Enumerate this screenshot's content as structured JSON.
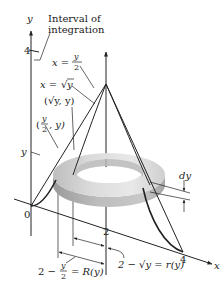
{
  "figure": {
    "axes": {
      "y_axis_label": "y",
      "x_axis_label": "x",
      "origin_label": "0",
      "y_tick_4": "4",
      "x_tick_2": "2",
      "x_tick_4": "4",
      "y_marker": "y"
    },
    "annotations": {
      "interval_line1": "Interval of",
      "interval_line2": "integration",
      "x_eq_label": "x =",
      "y_over_2_num": "y",
      "y_over_2_den": "2",
      "x_eq_sqrt_prefix": "x =",
      "sqrt_y": "y",
      "point_sqrt": "(√y, y)",
      "point_half_open": "(",
      "point_half_num": "y",
      "point_half_den": "2",
      "point_half_close": ", y)",
      "dy_label": "dy",
      "R_prefix": "2 −",
      "R_num": "y",
      "R_den": "2",
      "R_suffix": "= R(y)",
      "r_label": "2 − √y = r(y)"
    },
    "colors": {
      "ink": "#222222",
      "washer_light": "#e6e6e6",
      "washer_mid": "#c9c9c9",
      "washer_dark": "#a8a8a8",
      "background": "#ffffff"
    }
  }
}
